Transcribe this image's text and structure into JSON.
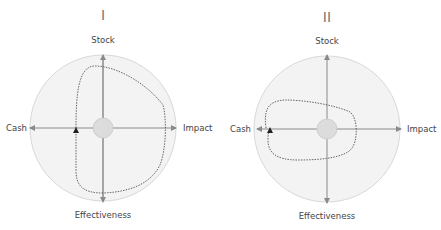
{
  "panels": [
    {
      "title": "I",
      "axes": {
        "top": "Stock",
        "bottom": "Effectiveness",
        "left": "Cash",
        "right": "Impact"
      },
      "description": "Large dotted loop spanning Stock, Impact and Effectiveness; marker arrow on left near Cash axis"
    },
    {
      "title": "II",
      "axes": {
        "top": "Stock",
        "bottom": "Effectiveness",
        "left": "Cash",
        "right": "Impact"
      },
      "description": "Small dotted loop concentrated toward Cash, crossing Impact axis near center"
    }
  ],
  "colors": {
    "disc": "#f3f3f3",
    "disc_stroke": "#d8d8d8",
    "axis": "#8a8a8a",
    "center": "#dcdcdc",
    "loop": "#555555"
  }
}
